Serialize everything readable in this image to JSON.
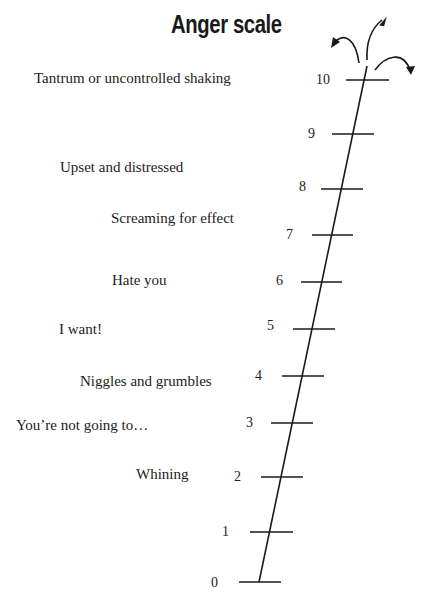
{
  "title": "Anger scale",
  "levels": [
    {
      "value": "0",
      "label": ""
    },
    {
      "value": "1",
      "label": ""
    },
    {
      "value": "2",
      "label": "Whining"
    },
    {
      "value": "3",
      "label": "You’re not going to…"
    },
    {
      "value": "4",
      "label": "Niggles and grumbles"
    },
    {
      "value": "5",
      "label": "I want!"
    },
    {
      "value": "6",
      "label": "Hate you"
    },
    {
      "value": "7",
      "label": "Screaming for effect"
    },
    {
      "value": "8",
      "label": "Upset and distressed"
    },
    {
      "value": "9",
      "label": ""
    },
    {
      "value": "10",
      "label": "Tantrum or uncontrolled shaking"
    }
  ],
  "icons": {
    "top": "explosion-arrows-icon"
  },
  "colors": {
    "ink": "#1a1a1a",
    "background": "#ffffff"
  }
}
